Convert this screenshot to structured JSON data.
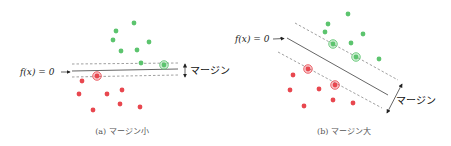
{
  "panels": [
    {
      "id": "a",
      "caption": "(a) マージン小",
      "hyperplane_label": "f(x) = 0",
      "margin_label": "マージン",
      "green_points": [
        [
          134,
          23
        ],
        [
          116,
          31
        ],
        [
          113,
          40
        ],
        [
          149,
          42
        ],
        [
          121,
          51
        ],
        [
          137,
          50
        ],
        [
          141,
          63
        ]
      ],
      "green_support_vectors": [
        [
          164,
          65
        ]
      ],
      "red_points": [
        [
          82,
          81
        ],
        [
          79,
          94
        ],
        [
          107,
          94
        ],
        [
          122,
          90
        ],
        [
          120,
          104
        ],
        [
          140,
          107
        ],
        [
          93,
          110
        ]
      ],
      "red_support_vectors": [
        [
          97,
          76
        ]
      ],
      "solid_line": [
        [
          72,
          71
        ],
        [
          178,
          69
        ]
      ],
      "upper_dashed": [
        [
          72,
          64
        ],
        [
          178,
          63
        ]
      ],
      "lower_dashed": [
        [
          72,
          77
        ],
        [
          178,
          75
        ]
      ]
    },
    {
      "id": "b",
      "caption": "(b) マージン大",
      "hyperplane_label": "f(x) = 0",
      "margin_label": "マージン",
      "green_points": [
        [
          348,
          14
        ],
        [
          328,
          24
        ],
        [
          325,
          32
        ],
        [
          363,
          34
        ],
        [
          351,
          43
        ],
        [
          379,
          59
        ]
      ],
      "green_support_vectors": [
        [
          333,
          44
        ],
        [
          356,
          57
        ]
      ],
      "red_points": [
        [
          293,
          75
        ],
        [
          290,
          90
        ],
        [
          319,
          89
        ],
        [
          333,
          100
        ],
        [
          353,
          103
        ],
        [
          304,
          106
        ]
      ],
      "red_support_vectors": [
        [
          308,
          69
        ],
        [
          335,
          85
        ]
      ],
      "solid_line": [
        [
          287,
          38
        ],
        [
          388,
          95
        ]
      ],
      "upper_dashed": [
        [
          295,
          23
        ],
        [
          398,
          80
        ]
      ],
      "lower_dashed": [
        [
          278,
          52
        ],
        [
          382,
          108
        ]
      ]
    }
  ],
  "colors": {
    "green": "#5cc46e",
    "red": "#e8474f",
    "line": "#555555",
    "dashed": "#888888"
  }
}
